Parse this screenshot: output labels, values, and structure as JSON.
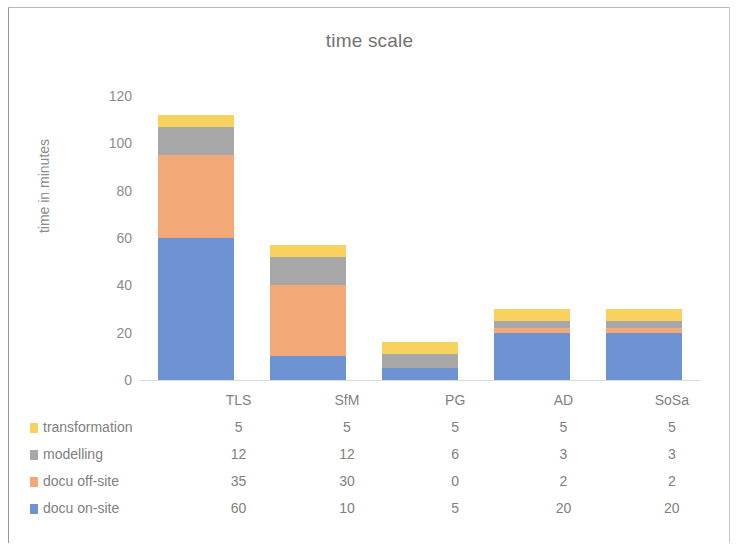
{
  "chart_data": {
    "type": "bar",
    "subtype": "stacked-column",
    "title": "time scale",
    "xlabel": "",
    "ylabel": "time in minutes",
    "ylim": [
      0,
      120
    ],
    "yticks": [
      0,
      20,
      40,
      60,
      80,
      100,
      120
    ],
    "ytick_labels": [
      "0",
      "20",
      "40",
      "60",
      "80",
      "100",
      "120"
    ],
    "grid": false,
    "legend_position": "table-bottom-left",
    "categories": [
      "TLS",
      "SfM",
      "PG",
      "AD",
      "SoSa"
    ],
    "series": [
      {
        "name": "docu on-site",
        "values": [
          60,
          10,
          5,
          20,
          20
        ],
        "color": "#6E93D2"
      },
      {
        "name": "docu off-site",
        "values": [
          35,
          30,
          0,
          2,
          2
        ],
        "color": "#F2A977"
      },
      {
        "name": "modelling",
        "values": [
          12,
          12,
          6,
          3,
          3
        ],
        "color": "#A8A8A8"
      },
      {
        "name": "transformation",
        "values": [
          5,
          5,
          5,
          5,
          5
        ],
        "color": "#F7D25E"
      }
    ],
    "totals": [
      112,
      57,
      16,
      30,
      30
    ],
    "stack_order_bottom_to_top": [
      "docu on-site",
      "docu off-site",
      "modelling",
      "transformation"
    ]
  },
  "table": {
    "corner_label": "",
    "column_headers": [
      "TLS",
      "SfM",
      "PG",
      "AD",
      "SoSa"
    ],
    "rows": [
      {
        "label": "transformation",
        "swatch": "#F7D25E",
        "values": [
          "5",
          "5",
          "5",
          "5",
          "5"
        ]
      },
      {
        "label": "modelling",
        "swatch": "#A8A8A8",
        "values": [
          "12",
          "12",
          "6",
          "3",
          "3"
        ]
      },
      {
        "label": "docu off-site",
        "swatch": "#F2A977",
        "values": [
          "35",
          "30",
          "0",
          "2",
          "2"
        ]
      },
      {
        "label": "docu on-site",
        "swatch": "#6E93D2",
        "values": [
          "60",
          "10",
          "5",
          "20",
          "20"
        ]
      }
    ]
  },
  "colors": {
    "transformation": "#F7D25E",
    "modelling": "#A8A8A8",
    "docu_off_site": "#F2A977",
    "docu_on_site": "#6E93D2",
    "text": "#808080",
    "title": "#767171",
    "axis": "#d9d9d9"
  }
}
